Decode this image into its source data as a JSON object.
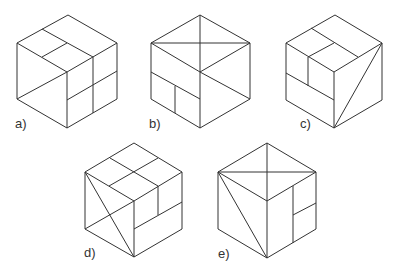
{
  "figure": {
    "stroke_color": "#333333",
    "stroke_width": 1,
    "cubes": [
      {
        "label": "a)",
        "label_pos": [
          15,
          117
        ],
        "outline": [
          [
            68,
            15
          ],
          [
            117,
            43
          ],
          [
            117,
            99
          ],
          [
            67,
            128
          ],
          [
            17,
            99
          ],
          [
            17,
            43
          ]
        ],
        "lines": [
          [
            [
              17,
              43
            ],
            [
              67,
              72
            ]
          ],
          [
            [
              67,
              72
            ],
            [
              117,
              43
            ]
          ],
          [
            [
              67,
              72
            ],
            [
              67,
              128
            ]
          ],
          [
            [
              42,
              29
            ],
            [
              93,
              57
            ]
          ],
          [
            [
              42,
              57
            ],
            [
              67,
              43
            ]
          ],
          [
            [
              93,
              57
            ],
            [
              93,
              113
            ]
          ],
          [
            [
              67,
              100
            ],
            [
              117,
              71
            ]
          ],
          [
            [
              17,
              99
            ],
            [
              67,
              72
            ]
          ]
        ]
      },
      {
        "label": "b)",
        "label_pos": [
          149,
          117
        ],
        "outline": [
          [
            200,
            15
          ],
          [
            250,
            43
          ],
          [
            250,
            99
          ],
          [
            200,
            128
          ],
          [
            151,
            99
          ],
          [
            151,
            43
          ]
        ],
        "lines": [
          [
            [
              151,
              43
            ],
            [
              200,
              72
            ]
          ],
          [
            [
              200,
              72
            ],
            [
              250,
              43
            ]
          ],
          [
            [
              200,
              72
            ],
            [
              200,
              128
            ]
          ],
          [
            [
              151,
              43
            ],
            [
              250,
              43
            ]
          ],
          [
            [
              200,
              15
            ],
            [
              200,
              72
            ]
          ],
          [
            [
              151,
              72
            ],
            [
              200,
              99
            ]
          ],
          [
            [
              175,
              86
            ],
            [
              175,
              113
            ]
          ],
          [
            [
              200,
              72
            ],
            [
              250,
              99
            ]
          ]
        ]
      },
      {
        "label": "c)",
        "label_pos": [
          300,
          117
        ],
        "outline": [
          [
            335,
            15
          ],
          [
            382,
            43
          ],
          [
            382,
            100
          ],
          [
            334,
            128
          ],
          [
            286,
            100
          ],
          [
            286,
            43
          ]
        ],
        "lines": [
          [
            [
              286,
              43
            ],
            [
              334,
              72
            ]
          ],
          [
            [
              334,
              72
            ],
            [
              382,
              43
            ]
          ],
          [
            [
              334,
              72
            ],
            [
              334,
              128
            ]
          ],
          [
            [
              311,
              28
            ],
            [
              358,
              57
            ]
          ],
          [
            [
              308,
              57
            ],
            [
              334,
              43
            ]
          ],
          [
            [
              308,
              57
            ],
            [
              308,
              86
            ]
          ],
          [
            [
              286,
              73
            ],
            [
              334,
              100
            ]
          ],
          [
            [
              334,
              128
            ],
            [
              382,
              43
            ]
          ]
        ]
      },
      {
        "label": "d)",
        "label_pos": [
          84,
          246
        ],
        "outline": [
          [
            134,
            143
          ],
          [
            182,
            172
          ],
          [
            182,
            229
          ],
          [
            134,
            257
          ],
          [
            85,
            229
          ],
          [
            85,
            172
          ]
        ],
        "lines": [
          [
            [
              85,
              172
            ],
            [
              134,
              201
            ]
          ],
          [
            [
              134,
              201
            ],
            [
              182,
              172
            ]
          ],
          [
            [
              134,
              201
            ],
            [
              134,
              257
            ]
          ],
          [
            [
              110,
              158
            ],
            [
              158,
              186
            ]
          ],
          [
            [
              158,
              158
            ],
            [
              109,
              186
            ]
          ],
          [
            [
              158,
              186
            ],
            [
              158,
              215
            ]
          ],
          [
            [
              134,
              229
            ],
            [
              182,
              202
            ]
          ],
          [
            [
              85,
              172
            ],
            [
              134,
              257
            ]
          ],
          [
            [
              85,
              229
            ],
            [
              134,
              201
            ]
          ]
        ]
      },
      {
        "label": "e)",
        "label_pos": [
          218,
          247
        ],
        "outline": [
          [
            267,
            143
          ],
          [
            316,
            172
          ],
          [
            316,
            229
          ],
          [
            267,
            258
          ],
          [
            218,
            229
          ],
          [
            218,
            172
          ]
        ],
        "lines": [
          [
            [
              218,
              172
            ],
            [
              267,
              201
            ]
          ],
          [
            [
              267,
              201
            ],
            [
              316,
              172
            ]
          ],
          [
            [
              267,
              201
            ],
            [
              267,
              258
            ]
          ],
          [
            [
              218,
              172
            ],
            [
              316,
              172
            ]
          ],
          [
            [
              267,
              143
            ],
            [
              267,
              201
            ]
          ],
          [
            [
              218,
              172
            ],
            [
              267,
              258
            ]
          ],
          [
            [
              293,
              186
            ],
            [
              293,
              243
            ]
          ],
          [
            [
              293,
              215
            ],
            [
              316,
              203
            ]
          ]
        ]
      }
    ]
  }
}
